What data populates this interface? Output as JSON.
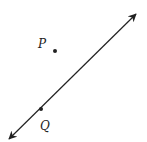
{
  "diagram": {
    "line": {
      "x1": 9,
      "y1": 139,
      "x2": 136,
      "y2": 14,
      "color": "#222222",
      "arrows": "both"
    },
    "points": [
      {
        "label": "P",
        "x": 55,
        "y": 51,
        "label_x": 38,
        "label_y": 48
      },
      {
        "label": "Q",
        "x": 41,
        "y": 109,
        "label_x": 40,
        "label_y": 130
      }
    ]
  }
}
